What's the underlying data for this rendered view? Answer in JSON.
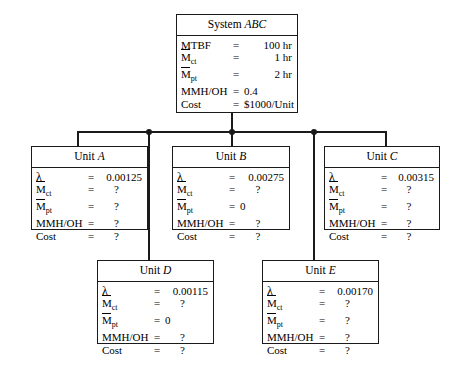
{
  "diagram": {
    "system": {
      "name": "System ABC",
      "name_prefix": "System ",
      "name_italic": "ABC",
      "rows": [
        {
          "label": "MTBF",
          "eq": "=",
          "value": "100 hr"
        },
        {
          "label": "Mct",
          "label_base": "M",
          "label_sub": "ct",
          "overbar": true,
          "eq": "=",
          "value": "1 hr"
        },
        {
          "label": "Mpt",
          "label_base": "M",
          "label_sub": "pt",
          "overbar": true,
          "eq": "=",
          "value": "2 hr"
        },
        {
          "label": "MMH/OH",
          "eq": "=",
          "value": "0.4"
        },
        {
          "label": "Cost",
          "eq": "=",
          "value": "$1000/Unit"
        }
      ]
    },
    "units": [
      {
        "id": "unit-a",
        "name": "Unit A",
        "name_prefix": "Unit ",
        "name_italic": "A",
        "rows": [
          {
            "label": "λ",
            "eq": "=",
            "value": "0.00125"
          },
          {
            "label": "Mct",
            "label_base": "M",
            "label_sub": "ct",
            "overbar": true,
            "eq": "=",
            "value": "?"
          },
          {
            "label": "Mpt",
            "label_base": "M",
            "label_sub": "pt",
            "overbar": true,
            "eq": "=",
            "value": "?"
          },
          {
            "label": "MMH/OH",
            "eq": "=",
            "value": "?"
          },
          {
            "label": "Cost",
            "eq": "=",
            "value": "?"
          }
        ]
      },
      {
        "id": "unit-b",
        "name": "Unit B",
        "name_prefix": "Unit ",
        "name_italic": "B",
        "rows": [
          {
            "label": "λ",
            "eq": "=",
            "value": "0.00275"
          },
          {
            "label": "Mct",
            "label_base": "M",
            "label_sub": "ct",
            "overbar": true,
            "eq": "=",
            "value": "?"
          },
          {
            "label": "Mpt",
            "label_base": "M",
            "label_sub": "pt",
            "overbar": true,
            "eq": "=",
            "value": "0"
          },
          {
            "label": "MMH/OH",
            "eq": "=",
            "value": "?"
          },
          {
            "label": "Cost",
            "eq": "=",
            "value": "?"
          }
        ]
      },
      {
        "id": "unit-c",
        "name": "Unit C",
        "name_prefix": "Unit ",
        "name_italic": "C",
        "rows": [
          {
            "label": "λ",
            "eq": "=",
            "value": "0.00315"
          },
          {
            "label": "Mct",
            "label_base": "M",
            "label_sub": "ct",
            "overbar": true,
            "eq": "=",
            "value": "?"
          },
          {
            "label": "Mpt",
            "label_base": "M",
            "label_sub": "pt",
            "overbar": true,
            "eq": "=",
            "value": "?"
          },
          {
            "label": "MMH/OH",
            "eq": "=",
            "value": "?"
          },
          {
            "label": "Cost",
            "eq": "=",
            "value": "?"
          }
        ]
      },
      {
        "id": "unit-d",
        "name": "Unit D",
        "name_prefix": "Unit ",
        "name_italic": "D",
        "rows": [
          {
            "label": "λ",
            "eq": "=",
            "value": "0.00115"
          },
          {
            "label": "Mct",
            "label_base": "M",
            "label_sub": "ct",
            "overbar": true,
            "eq": "=",
            "value": "?"
          },
          {
            "label": "Mpt",
            "label_base": "M",
            "label_sub": "pt",
            "overbar": true,
            "eq": "=",
            "value": "0"
          },
          {
            "label": "MMH/OH",
            "eq": "=",
            "value": "?"
          },
          {
            "label": "Cost",
            "eq": "=",
            "value": "?"
          }
        ]
      },
      {
        "id": "unit-e",
        "name": "Unit E",
        "name_prefix": "Unit ",
        "name_italic": "E",
        "rows": [
          {
            "label": "λ",
            "eq": "=",
            "value": "0.00170"
          },
          {
            "label": "Mct",
            "label_base": "M",
            "label_sub": "ct",
            "overbar": true,
            "eq": "=",
            "value": "?"
          },
          {
            "label": "Mpt",
            "label_base": "M",
            "label_sub": "pt",
            "overbar": true,
            "eq": "=",
            "value": "?"
          },
          {
            "label": "MMH/OH",
            "eq": "=",
            "value": "?"
          },
          {
            "label": "Cost",
            "eq": "=",
            "value": "?"
          }
        ]
      }
    ],
    "colors": {
      "line": "#1a1a1a",
      "background": "#ffffff",
      "text": "#000000"
    }
  }
}
